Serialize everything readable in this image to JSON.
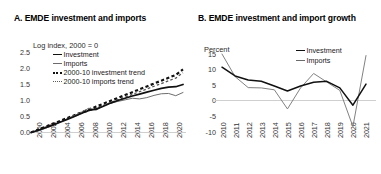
{
  "figure": {
    "panels": [
      "A",
      "B"
    ]
  },
  "panelA": {
    "title": "A. EMDE investment and imports",
    "axis_label": "Log index, 2000 = 0",
    "legend": [
      {
        "label": "Investment",
        "style": "solid-thick"
      },
      {
        "label": "Imports",
        "style": "solid-thin"
      },
      {
        "label": "2000-10 investment trend",
        "style": "dash-thick"
      },
      {
        "label": "2000-10 imports trend",
        "style": "dash-thin"
      }
    ],
    "yticks": [
      "0.0",
      "0.5",
      "1.0",
      "1.5",
      "2.0",
      "2.5"
    ],
    "xticks": [
      "2000",
      "2002",
      "2004",
      "2006",
      "2008",
      "2010",
      "2012",
      "2014",
      "2016",
      "2018",
      "2020"
    ]
  },
  "panelB": {
    "title": "B. EMDE investment and import growth",
    "axis_label": "Percent",
    "legend": [
      {
        "label": "Investment",
        "style": "solid-thick"
      },
      {
        "label": "Imports",
        "style": "solid-thin"
      }
    ],
    "yticks": [
      "-10",
      "-5",
      "0",
      "5",
      "10",
      "15"
    ],
    "xticks": [
      "2010",
      "2011",
      "2012",
      "2013",
      "2014",
      "2015",
      "2016",
      "2017",
      "2018",
      "2019",
      "2020",
      "2021"
    ]
  },
  "colors": {
    "investment": "#111111",
    "imports": "#6e6e6e",
    "axis": "#c9c9c9",
    "text": "#1a1a1a",
    "background": "#ffffff"
  },
  "chart_data": [
    {
      "type": "line",
      "panel": "A",
      "title": "A. EMDE investment and imports",
      "xlabel": "",
      "ylabel": "Log index, 2000 = 0",
      "ylim": [
        0.0,
        2.5
      ],
      "xlim": [
        2000,
        2021
      ],
      "grid": false,
      "legend_position": "upper-left",
      "x": [
        2000,
        2001,
        2002,
        2003,
        2004,
        2005,
        2006,
        2007,
        2008,
        2009,
        2010,
        2011,
        2012,
        2013,
        2014,
        2015,
        2016,
        2017,
        2018,
        2019,
        2020,
        2021
      ],
      "series": [
        {
          "name": "Investment",
          "style": "solid-thick",
          "values": [
            0.0,
            0.07,
            0.15,
            0.23,
            0.32,
            0.41,
            0.5,
            0.6,
            0.69,
            0.73,
            0.82,
            0.92,
            1.0,
            1.07,
            1.14,
            1.2,
            1.26,
            1.32,
            1.38,
            1.42,
            1.43,
            1.5
          ]
        },
        {
          "name": "Imports",
          "style": "solid-thin",
          "values": [
            0.0,
            0.05,
            0.13,
            0.22,
            0.32,
            0.42,
            0.53,
            0.64,
            0.76,
            0.7,
            0.83,
            0.92,
            0.97,
            1.02,
            1.07,
            1.05,
            1.09,
            1.16,
            1.21,
            1.22,
            1.15,
            1.25
          ]
        },
        {
          "name": "2000-10 investment trend",
          "style": "dash-thick",
          "values": [
            0.0,
            0.09,
            0.18,
            0.27,
            0.36,
            0.45,
            0.54,
            0.63,
            0.72,
            0.81,
            0.9,
            0.99,
            1.08,
            1.17,
            1.26,
            1.35,
            1.44,
            1.53,
            1.62,
            1.71,
            1.8,
            1.97
          ]
        },
        {
          "name": "2000-10 imports trend",
          "style": "dash-thin",
          "values": [
            0.0,
            0.085,
            0.17,
            0.255,
            0.34,
            0.425,
            0.51,
            0.595,
            0.68,
            0.765,
            0.85,
            0.935,
            1.02,
            1.105,
            1.19,
            1.275,
            1.36,
            1.445,
            1.53,
            1.615,
            1.7,
            1.87
          ]
        }
      ]
    },
    {
      "type": "line",
      "panel": "B",
      "title": "B. EMDE investment and import growth",
      "xlabel": "",
      "ylabel": "Percent",
      "ylim": [
        -10,
        15
      ],
      "xlim": [
        2010,
        2021
      ],
      "grid": false,
      "legend_position": "upper-right",
      "x": [
        2010,
        2011,
        2012,
        2013,
        2014,
        2015,
        2016,
        2017,
        2018,
        2019,
        2020,
        2021
      ],
      "series": [
        {
          "name": "Investment",
          "style": "solid-thick",
          "values": [
            10.8,
            8.0,
            6.7,
            6.3,
            4.8,
            3.2,
            4.8,
            6.0,
            6.3,
            4.2,
            -1.3,
            5.4
          ]
        },
        {
          "name": "Imports",
          "style": "solid-thin",
          "values": [
            15.0,
            7.8,
            4.3,
            4.2,
            3.6,
            -2.5,
            4.2,
            8.8,
            6.1,
            3.4,
            -8.1,
            14.5
          ]
        }
      ]
    }
  ]
}
